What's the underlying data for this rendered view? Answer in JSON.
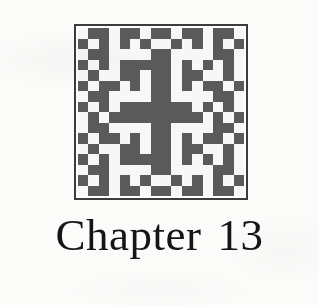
{
  "page": {
    "background_color": "#fbfbfa",
    "text_color": "#151515"
  },
  "figure": {
    "name": "fractal-square-plate",
    "frame_color": "#3c3c3c",
    "fill_color": "#5a5a5a",
    "background_color": "#f7f7f5",
    "grid_size": 16,
    "grid_rows": [
      "0110110110110110",
      "1010101001010101",
      "0110000110000110",
      "1010111110101010",
      "0100110110110010",
      "1011010110101101",
      "0110000110000110",
      "1010111111101010",
      "0101111111110101",
      "0110000110000110",
      "1011010110101101",
      "0100110110110010",
      "1010111110101010",
      "0110000110000110",
      "1010101001010101",
      "0110110110110110"
    ]
  },
  "caption": {
    "label": "Chapter 13",
    "word": "Chapter",
    "number": "13"
  }
}
